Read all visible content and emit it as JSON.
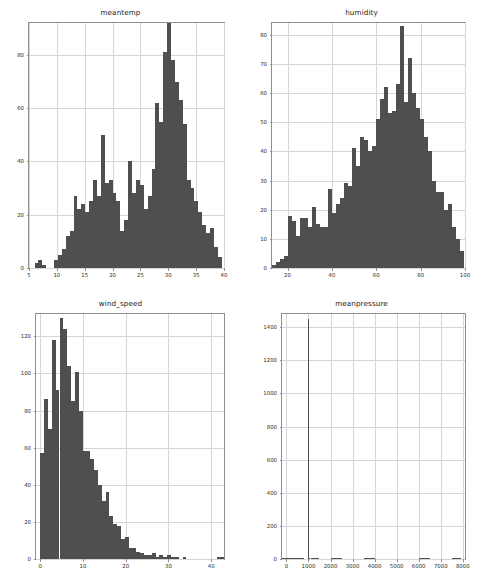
{
  "figure": {
    "width": 482,
    "height": 582,
    "background": "#ffffff",
    "bar_color": "#4f4f4f",
    "grid_color": "#d6d6d6",
    "axis_color": "#8f8f8f",
    "tick_label_color": "#2b2b2b"
  },
  "chart_data": [
    {
      "type": "bar",
      "subplot": "top-left",
      "title": "meantemp",
      "xlabel": "",
      "ylabel": "",
      "grid": true,
      "legend": "none",
      "xlim": [
        5,
        40
      ],
      "ylim": [
        0,
        92
      ],
      "xticks": [
        5,
        10,
        15,
        20,
        25,
        30,
        35,
        40
      ],
      "yticks": [
        0,
        20,
        40,
        60,
        80
      ],
      "bin_edges": [
        6.0,
        6.7,
        7.4,
        8.1,
        8.8,
        9.5,
        10.2,
        10.9,
        11.6,
        12.3,
        13.0,
        13.7,
        14.4,
        15.1,
        15.8,
        16.5,
        17.2,
        17.9,
        18.6,
        19.3,
        20.0,
        20.7,
        21.4,
        22.1,
        22.8,
        23.5,
        24.2,
        24.9,
        25.6,
        26.3,
        27.0,
        27.7,
        28.4,
        29.1,
        29.8,
        30.5,
        31.2,
        31.9,
        32.6,
        33.3,
        34.0,
        34.7,
        35.4,
        36.1,
        36.8,
        37.5,
        38.2,
        38.9
      ],
      "values": [
        2,
        3,
        1,
        0,
        0,
        3,
        5,
        7,
        12,
        14,
        27,
        22,
        24,
        21,
        25,
        33,
        27,
        50,
        32,
        33,
        28,
        25,
        14,
        18,
        40,
        28,
        33,
        31,
        22,
        27,
        37,
        62,
        55,
        81,
        92,
        78,
        70,
        63,
        54,
        33,
        30,
        25,
        21,
        16,
        13,
        15,
        8,
        4
      ]
    },
    {
      "type": "bar",
      "subplot": "top-right",
      "title": "humidity",
      "xlabel": "",
      "ylabel": "",
      "grid": true,
      "legend": "none",
      "xlim": [
        13,
        100
      ],
      "ylim": [
        0,
        84
      ],
      "xticks": [
        20,
        40,
        60,
        80,
        100
      ],
      "yticks": [
        0,
        10,
        20,
        30,
        40,
        50,
        60,
        70,
        80
      ],
      "bin_edges": [
        13.0,
        14.8,
        16.6,
        18.4,
        20.2,
        22.0,
        23.8,
        25.6,
        27.4,
        29.2,
        31.0,
        32.8,
        34.6,
        36.4,
        38.2,
        40.0,
        41.8,
        43.6,
        45.4,
        47.2,
        49.0,
        50.8,
        52.6,
        54.4,
        56.2,
        58.0,
        59.8,
        61.6,
        63.4,
        65.2,
        67.0,
        68.8,
        70.6,
        72.4,
        74.2,
        76.0,
        77.8,
        79.6,
        81.4,
        83.2,
        85.0,
        86.8,
        88.6,
        90.4,
        92.2,
        94.0,
        95.8,
        97.6
      ],
      "values": [
        1,
        2,
        3,
        4,
        18,
        16,
        11,
        17,
        17,
        14,
        21,
        15,
        14,
        14,
        27,
        19,
        22,
        24,
        29,
        28,
        41,
        35,
        45,
        44,
        40,
        42,
        51,
        58,
        62,
        53,
        54,
        63,
        83,
        57,
        72,
        60,
        55,
        51,
        45,
        40,
        30,
        26,
        26,
        20,
        22,
        14,
        10,
        6
      ]
    },
    {
      "type": "bar",
      "subplot": "bottom-left",
      "title": "wind_speed",
      "xlabel": "",
      "ylabel": "",
      "grid": true,
      "legend": "none",
      "xlim": [
        -1,
        43
      ],
      "ylim": [
        0,
        132
      ],
      "xticks": [
        0,
        10,
        20,
        30,
        40
      ],
      "yticks": [
        0,
        20,
        40,
        60,
        80,
        100,
        120
      ],
      "bin_edges": [
        0.0,
        0.9,
        1.8,
        2.7,
        3.6,
        4.5,
        5.4,
        6.3,
        7.2,
        8.1,
        9.0,
        9.9,
        10.8,
        11.7,
        12.6,
        13.5,
        14.4,
        15.3,
        16.2,
        17.1,
        18.0,
        18.9,
        19.8,
        20.7,
        21.6,
        22.5,
        23.4,
        24.3,
        25.2,
        26.1,
        27.0,
        27.9,
        28.8,
        29.7,
        30.6,
        31.5,
        32.4,
        33.3,
        34.2,
        35.1,
        36.0,
        36.9,
        37.8,
        38.7,
        39.6,
        40.5,
        41.4,
        42.3
      ],
      "values": [
        57,
        86,
        70,
        118,
        91,
        130,
        124,
        104,
        85,
        101,
        80,
        58,
        58,
        54,
        48,
        40,
        31,
        36,
        23,
        19,
        18,
        11,
        12,
        6,
        6,
        4,
        3,
        2,
        2,
        3,
        1,
        2,
        1,
        2,
        1,
        1,
        0,
        1,
        0,
        0,
        0,
        0,
        0,
        0,
        0,
        0,
        1,
        1
      ]
    },
    {
      "type": "bar",
      "subplot": "bottom-right",
      "title": "meanpressure",
      "xlabel": "",
      "ylabel": "",
      "grid": true,
      "legend": "none",
      "xlim": [
        -200,
        8100
      ],
      "ylim": [
        0,
        1480
      ],
      "xticks": [
        0,
        1000,
        2000,
        3000,
        4000,
        5000,
        6000,
        7000,
        8000
      ],
      "yticks": [
        0,
        200,
        400,
        600,
        800,
        1000,
        1200,
        1400
      ],
      "bin_edges": [
        -200,
        766,
        800,
        834,
        868,
        902,
        936,
        970,
        1004,
        1038,
        1072,
        1106,
        1500,
        2000,
        2500,
        3000,
        3500,
        4000,
        4500,
        5000,
        5500,
        6000,
        6500,
        7000,
        7500,
        7900
      ],
      "values": [
        3,
        1,
        0,
        0,
        0,
        0,
        0,
        1450,
        4,
        1,
        0,
        1,
        0,
        1,
        0,
        0,
        1,
        0,
        0,
        0,
        0,
        1,
        0,
        0,
        1
      ]
    }
  ]
}
